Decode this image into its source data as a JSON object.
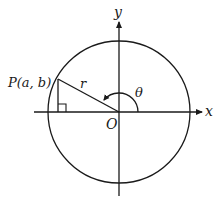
{
  "diagram": {
    "labels": {
      "y_axis": "y",
      "x_axis": "x",
      "origin": "O",
      "point": "P(a, b)",
      "radius": "r",
      "angle": "θ"
    },
    "geometry": {
      "center": [
        119,
        112
      ],
      "radius": 71,
      "point": [
        58,
        78
      ],
      "stroke_color": "#1a1a1a",
      "background": "#ffffff"
    }
  }
}
